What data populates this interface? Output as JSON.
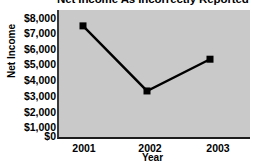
{
  "chart_data": {
    "type": "line",
    "title": "Net Income As Incorrectly Reported",
    "xlabel": "Year",
    "ylabel": "Net Income",
    "categories": [
      "2001",
      "2002",
      "2003"
    ],
    "values": [
      7000,
      2900,
      4900
    ],
    "series": [
      {
        "name": "Net Income",
        "values": [
          7000,
          2900,
          4900
        ]
      }
    ],
    "ylim": [
      0,
      8000
    ],
    "y_ticks": [
      8000,
      7000,
      6000,
      5000,
      4000,
      3000,
      2000,
      1000,
      0
    ],
    "y_tick_labels": [
      "$8,000",
      "$7,000",
      "$6,000",
      "$5,000",
      "$4,000",
      "$3,000",
      "$2,000",
      "$1,000",
      "$0"
    ],
    "x_tick_labels": [
      "2001",
      "2002",
      "2003"
    ],
    "grid": false,
    "legend": false,
    "legend_position": "none",
    "marker": "square",
    "colors": {
      "line": "#000000",
      "marker": "#000000",
      "plot_background": "#c9c9c9",
      "figure_background": "#ffffff",
      "axis": "#1c1c1c",
      "text": "#000000"
    }
  }
}
